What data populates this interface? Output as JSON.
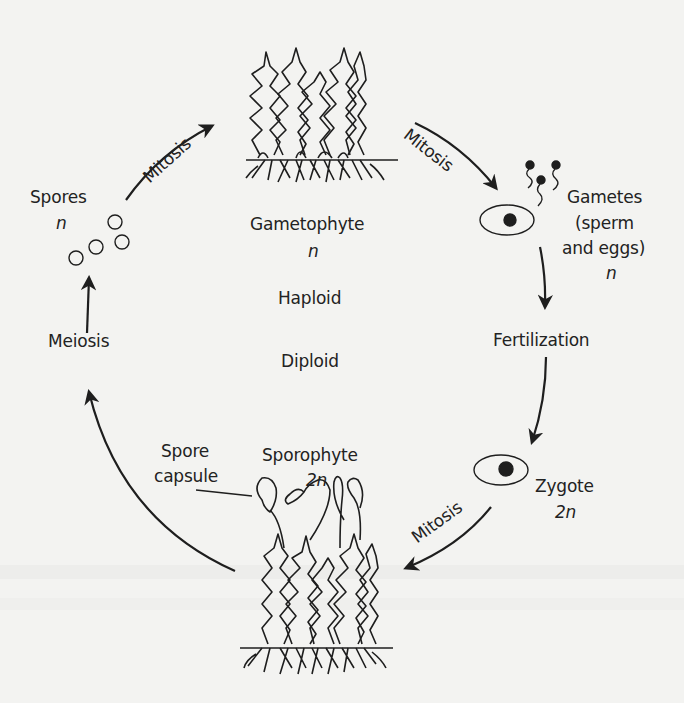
{
  "diagram": {
    "type": "life-cycle",
    "stages": {
      "gametophyte": {
        "name": "Gametophyte",
        "ploidy": "n"
      },
      "gametes": {
        "line1": "Gametes",
        "line2": "(sperm",
        "line3": "and eggs)",
        "ploidy": "n"
      },
      "zygote": {
        "name": "Zygote",
        "ploidy": "2n"
      },
      "sporophyte": {
        "name": "Sporophyte",
        "ploidy": "2n"
      },
      "spores": {
        "name": "Spores",
        "ploidy": "n"
      }
    },
    "processes": {
      "mitosis_spores_to_gametophyte": "Mitosis",
      "mitosis_gametophyte_to_gametes": "Mitosis",
      "fertilization": "Fertilization",
      "mitosis_zygote_to_sporophyte": "Mitosis",
      "meiosis": "Meiosis"
    },
    "phase_labels": {
      "haploid": "Haploid",
      "diploid": "Diploid"
    },
    "callouts": {
      "spore_capsule_line1": "Spore",
      "spore_capsule_line2": "capsule"
    },
    "colors": {
      "ink": "#1e1e1e",
      "paper": "#f3f3f1"
    }
  }
}
